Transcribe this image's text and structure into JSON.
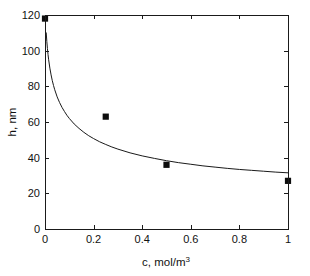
{
  "chart_data": {
    "type": "scatter",
    "title": "",
    "xlabel": "c, mol/m3",
    "xlabel_base": "c, mol/m",
    "xlabel_exponent": "3",
    "ylabel": "h, nm",
    "xlim": [
      0,
      1
    ],
    "ylim": [
      0,
      120
    ],
    "grid": false,
    "legend": null,
    "xticks": [
      0,
      0.2,
      0.4,
      0.6,
      0.8,
      1
    ],
    "xticklabels": [
      "0",
      "0.2",
      "0.4",
      "0.6",
      "0.8",
      "1"
    ],
    "yticks": [
      0,
      20,
      40,
      60,
      80,
      100,
      120
    ],
    "yticklabels": [
      "0",
      "20",
      "40",
      "60",
      "80",
      "100",
      "120"
    ],
    "series": [
      {
        "name": "measured",
        "type": "scatter",
        "marker": "filled-square",
        "color": "#0d0d0d",
        "x": [
          0,
          0.25,
          0.5,
          1
        ],
        "y": [
          118,
          63,
          36,
          27
        ]
      },
      {
        "name": "model",
        "type": "line",
        "color": "#1a1a1a",
        "x": [
          0.005,
          0.0075,
          0.01,
          0.0125,
          0.015,
          0.02,
          0.025,
          0.03,
          0.035,
          0.04,
          0.05,
          0.06,
          0.07,
          0.08,
          0.09,
          0.1,
          0.12,
          0.14,
          0.16,
          0.18,
          0.2,
          0.225,
          0.25,
          0.275,
          0.3,
          0.35,
          0.4,
          0.45,
          0.5,
          0.55,
          0.6,
          0.65,
          0.7,
          0.75,
          0.8,
          0.85,
          0.9,
          0.95,
          1
        ],
        "y": [
          110.0,
          105.2,
          101.2,
          97.8,
          94.9,
          90.2,
          86.4,
          83.2,
          80.5,
          78.1,
          74.1,
          70.9,
          68.2,
          65.9,
          63.8,
          62.0,
          58.9,
          56.4,
          54.2,
          52.3,
          50.7,
          48.9,
          47.4,
          46.0,
          44.8,
          42.7,
          41.0,
          39.6,
          38.3,
          37.2,
          36.3,
          35.4,
          34.7,
          34.0,
          33.4,
          32.9,
          32.4,
          31.9,
          31.5
        ]
      }
    ]
  },
  "figure": {
    "background_color": "#ffffff",
    "axis_color": "#1a1a1a",
    "marker_color": "#0d0d0d"
  }
}
